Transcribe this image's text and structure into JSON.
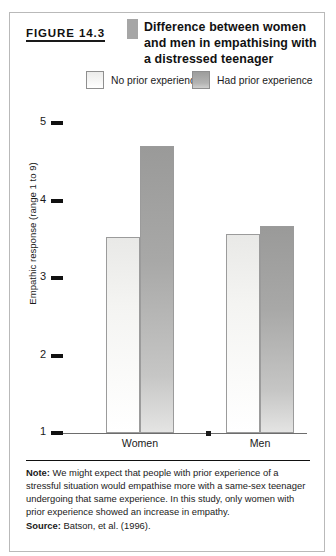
{
  "figure": {
    "number_label": "FIGURE 14.3",
    "title": "Difference between women and men in empathising with a distressed teenager"
  },
  "footnote": {
    "lead": "Note:",
    "text": " We might expect that people with prior experience of a stressful situation would empathise more with a same-sex teenager undergoing that same experience. In this study, only women with prior experience showed an increase in empathy."
  },
  "source": {
    "lead": "Source:",
    "text": " Batson, et al. (1996)."
  },
  "colors": {
    "light_bar": "#f4f4f2",
    "dark_bar": "#9a9a99",
    "bar_outline": "#9b9b9b",
    "axis": "#111111",
    "frame": "#b9b9b9",
    "tab": "#a6a6a6"
  },
  "chart_data": {
    "type": "bar",
    "title": "Difference between women and men in empathising with a distressed teenager",
    "xlabel": "",
    "ylabel": "Empathic response (range 1 to 9)",
    "categories": [
      "Women",
      "Men"
    ],
    "series": [
      {
        "name": "No prior experience",
        "values": [
          3.53,
          3.57
        ]
      },
      {
        "name": "Had prior experience",
        "values": [
          4.7,
          3.67
        ]
      }
    ],
    "ylim": [
      1,
      5.35
    ],
    "yticks": [
      1,
      2,
      3,
      4,
      5
    ],
    "ytick_labels": [
      "1",
      "2",
      "3",
      "4",
      "5"
    ],
    "grid": false,
    "legend_position": "top"
  }
}
